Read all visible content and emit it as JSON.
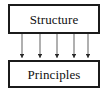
{
  "diagram": {
    "type": "flow-diagram",
    "background_color": "#ffffff",
    "nodes": [
      {
        "id": "structure",
        "label": "Structure",
        "shape": "rectangle",
        "border_color": "#1b1b1b",
        "fill_color": "#ffffff",
        "text_color": "#111111",
        "x": 8,
        "y": 4,
        "width": 92,
        "height": 30
      },
      {
        "id": "principles",
        "label": "Principles",
        "shape": "rectangle",
        "border_color": "#1b1b1b",
        "fill_color": "#ffffff",
        "text_color": "#111111",
        "x": 8,
        "y": 60,
        "width": 92,
        "height": 28
      }
    ],
    "edges": {
      "count": 5,
      "from": "structure",
      "to": "principles",
      "direction": "down",
      "style": "solid",
      "color": "#6f6f6f",
      "arrowhead": "filled-triangle",
      "arrowhead_color": "#2a2a2a",
      "x_positions": [
        22,
        40,
        57,
        74,
        88
      ],
      "y_start": 34,
      "y_end": 59
    }
  }
}
